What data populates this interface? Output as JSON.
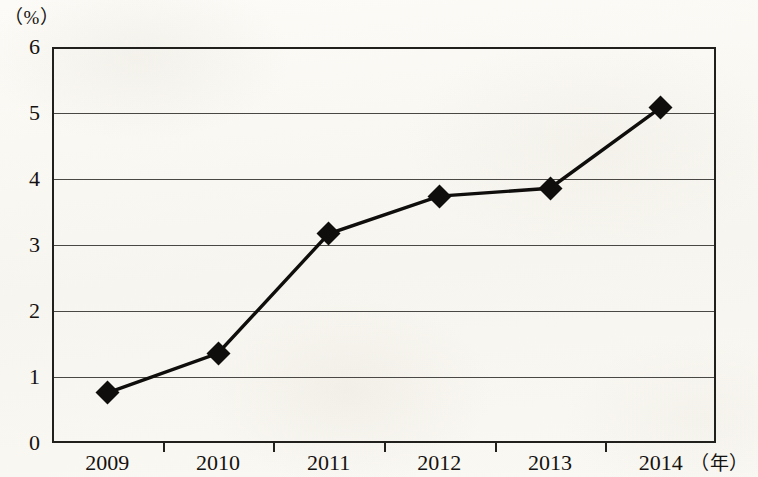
{
  "chart_data": {
    "type": "line",
    "title": "",
    "subtitle": "",
    "xlabel": "（年）",
    "ylabel": "（%）",
    "categories": [
      "2009",
      "2010",
      "2011",
      "2012",
      "2013",
      "2014"
    ],
    "values": [
      0.76,
      1.36,
      3.17,
      3.74,
      3.86,
      5.08
    ],
    "series": [
      {
        "name": "",
        "values": [
          0.76,
          1.36,
          3.17,
          3.74,
          3.86,
          5.08
        ]
      }
    ],
    "ylim": [
      0,
      6
    ],
    "y_ticks": [
      "0",
      "1",
      "2",
      "3",
      "4",
      "5",
      "6"
    ],
    "y_tick_values": [
      0,
      1,
      2,
      3,
      4,
      5,
      6
    ],
    "grid": "horizontal",
    "legend": "none",
    "marker": "diamond",
    "line_color": "#100e0c",
    "marker_color": "#100e0c",
    "grid_color": "#4a4844",
    "axis_color": "#22201d",
    "background_color": "#faf8f3"
  },
  "axes": {
    "y_unit": "（%）",
    "x_unit": "（年）"
  }
}
